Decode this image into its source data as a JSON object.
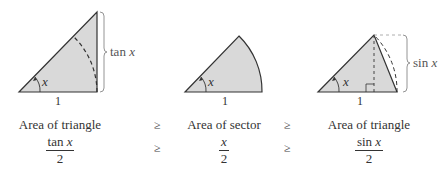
{
  "figures": [
    {
      "id": "outer-triangle",
      "side_label_func": "tan",
      "side_label_var": "x",
      "angle_label": "x",
      "base_label": "1"
    },
    {
      "id": "sector",
      "angle_label": "x",
      "base_label": "1"
    },
    {
      "id": "inner-triangle",
      "side_label_func": "sin",
      "side_label_var": "x",
      "angle_label": "x",
      "base_label": "1"
    }
  ],
  "captions": [
    "Area of triangle",
    "Area of sector",
    "Area of triangle"
  ],
  "relations": [
    "≥",
    "≥"
  ],
  "formulas": [
    {
      "num_func": "tan",
      "num_var": "x",
      "den": "2"
    },
    {
      "num_func": "",
      "num_var": "x",
      "den": "2"
    },
    {
      "num_func": "sin",
      "num_var": "x",
      "den": "2"
    }
  ],
  "colors": {
    "fill": "#d9d9d9",
    "stroke": "#333333",
    "brace": "#888888"
  }
}
